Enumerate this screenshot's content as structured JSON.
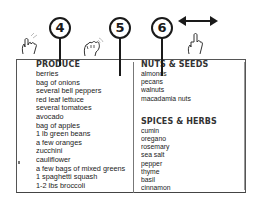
{
  "callouts": [
    {
      "label": "4",
      "target": "produce-column"
    },
    {
      "label": "5",
      "target": "column-divider"
    },
    {
      "label": "6",
      "target": "nuts-seeds-column"
    }
  ],
  "gestures": [
    {
      "icon": "tap-hand-icon",
      "near": "4"
    },
    {
      "icon": "swipe-hand-icon",
      "near": "5"
    },
    {
      "icon": "horizontal-drag-hand-icon",
      "near": "6"
    }
  ],
  "arrow_icon": "double-headed-horizontal-arrow",
  "columns": [
    {
      "sections": [
        {
          "heading": "PRODUCE",
          "items": [
            "berries",
            "bag of onions",
            "several bell peppers",
            "red leaf lettuce",
            "several tomatoes",
            "avocado",
            "bag of apples",
            "1 lb green beans",
            "a few oranges",
            "zucchini",
            "cauliflower",
            "a few bags of mixed greens",
            "1 spaghetti squash",
            "1-2 lbs broccoli",
            "bag of carrot sticks"
          ]
        }
      ]
    },
    {
      "sections": [
        {
          "heading": "NUTS & SEEDS",
          "items": [
            "almonds",
            "pecans",
            "walnuts",
            "macadamia nuts"
          ]
        },
        {
          "heading": "SPICES & HERBS",
          "items": [
            "cumin",
            "oregano",
            "rosemary",
            "sea salt",
            "pepper",
            "thyme",
            "basil",
            "cinnamon"
          ]
        }
      ]
    }
  ],
  "colors": {
    "ink": "#1a1a1a",
    "frame": "#555555",
    "text": "#222222",
    "background": "#ffffff"
  }
}
